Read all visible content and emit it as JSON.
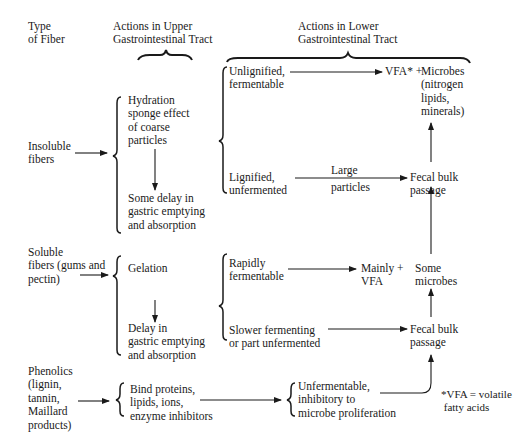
{
  "headers": {
    "type_of_fiber": "Type\nof Fiber",
    "upper_gi": "Actions in Upper\nGastrointestinal Tract",
    "lower_gi": "Actions in Lower\nGastrointestinal Tract"
  },
  "fibers": {
    "insoluble": "Insoluble\nfibers",
    "soluble": "Soluble\nfibers (gums and\npectin)",
    "phenolics": "Phenolics\n(lignin,\ntannin,\nMaillard\nproducts)"
  },
  "upper": {
    "insoluble_1": "Hydration\nsponge effect\nof coarse\nparticles",
    "insoluble_2": "Some delay in\ngastric emptying\nand absorption",
    "soluble_1": "Gelation",
    "soluble_2": "Delay in\ngastric emptying\nand absorption",
    "phenolics_1": "Bind proteins,\nlipids, ions,\nenzyme inhibitors"
  },
  "lower": {
    "unlignified": "Unlignified,\nfermentable",
    "vfa_plus": "VFA* +",
    "microbes": "Microbes\n(nitrogen\nlipids,\nminerals)",
    "lignified": "Lignified,\nunfermented",
    "large_particles_1": "Large",
    "large_particles_2": "particles",
    "fecal_bulk_1": "Fecal bulk\npassage",
    "rapidly": "Rapidly\nfermentable",
    "mainly_vfa": "Mainly +\nVFA",
    "some_microbes": "Some\nmicrobes",
    "slower": "Slower fermenting\nor part unfermented",
    "fecal_bulk_2": "Fecal bulk\npassage",
    "unfermentable": "Unfermentable,\ninhibitory to\nmicrobe proliferation"
  },
  "footnote": "*VFA = volatile\n fatty acids"
}
